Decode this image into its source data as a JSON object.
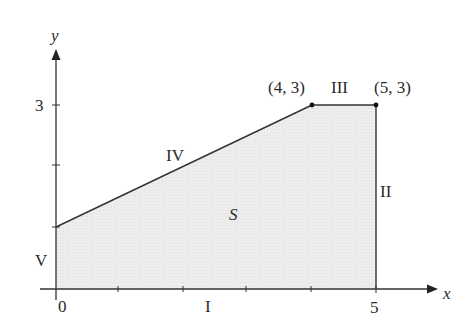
{
  "diagram": {
    "type": "region-on-coordinate-plane",
    "axes": {
      "x_label": "x",
      "y_label": "y",
      "origin_label": "0",
      "x_tick_label": "5",
      "y_tick_label": "3"
    },
    "region": {
      "label": "S",
      "vertices": [
        [
          0,
          0
        ],
        [
          5,
          0
        ],
        [
          5,
          3
        ],
        [
          4,
          3
        ],
        [
          0,
          1
        ]
      ],
      "fill_color": "#ececec",
      "edge_color": "#333333"
    },
    "points": [
      {
        "label": "(4, 3)",
        "x": 4,
        "y": 3
      },
      {
        "label": "(5, 3)",
        "x": 5,
        "y": 3
      }
    ],
    "edges": [
      {
        "label": "I",
        "from": [
          0,
          0
        ],
        "to": [
          5,
          0
        ]
      },
      {
        "label": "II",
        "from": [
          5,
          0
        ],
        "to": [
          5,
          3
        ]
      },
      {
        "label": "III",
        "from": [
          5,
          3
        ],
        "to": [
          4,
          3
        ]
      },
      {
        "label": "IV",
        "from": [
          4,
          3
        ],
        "to": [
          0,
          1
        ]
      },
      {
        "label": "V",
        "from": [
          0,
          1
        ],
        "to": [
          0,
          0
        ]
      }
    ]
  }
}
